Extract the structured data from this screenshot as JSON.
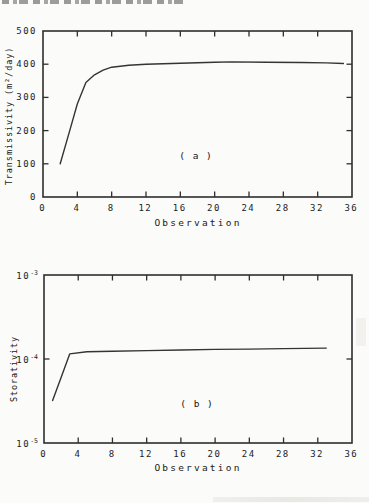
{
  "figure": {
    "description_labels": {
      "panel_a": "( a )",
      "panel_b": "( b )"
    }
  },
  "colors": {
    "ink": "#2e2e2e",
    "curve": "#343434",
    "paper": "#fbfbf9"
  },
  "chart_data": [
    {
      "type": "line",
      "panel_label": "( a )",
      "xlabel": "Observation",
      "ylabel": "Transmissivity (m²/day)",
      "xlim": [
        0,
        36
      ],
      "ylim": [
        0,
        500
      ],
      "yscale": "linear",
      "grid": false,
      "legend": "none",
      "xticks": [
        0,
        4,
        8,
        12,
        16,
        20,
        24,
        28,
        32,
        36
      ],
      "yticks": [
        0,
        100,
        200,
        300,
        400,
        500
      ],
      "x": [
        2,
        3,
        4,
        5,
        6,
        7,
        8,
        10,
        12,
        16,
        20,
        22,
        26,
        30,
        33,
        35
      ],
      "y": [
        100,
        190,
        280,
        345,
        368,
        382,
        391,
        397,
        400,
        403,
        406,
        407,
        406,
        405,
        404,
        402
      ]
    },
    {
      "type": "line",
      "panel_label": "( b )",
      "xlabel": "Observation",
      "ylabel": "Storativity",
      "xlim": [
        0,
        36
      ],
      "ylim": [
        1e-05,
        0.001
      ],
      "yscale": "log",
      "grid": false,
      "legend": "none",
      "xticks": [
        0,
        4,
        8,
        12,
        16,
        20,
        24,
        28,
        32,
        36
      ],
      "yticks": [
        1e-05,
        0.0001,
        0.001
      ],
      "x": [
        1,
        2,
        3,
        5,
        8,
        12,
        16,
        20,
        24,
        28,
        33
      ],
      "y": [
        3.2e-05,
        6e-05,
        0.000115,
        0.000122,
        0.000124,
        0.000126,
        0.000128,
        0.00013,
        0.000131,
        0.000133,
        0.000135
      ]
    }
  ]
}
